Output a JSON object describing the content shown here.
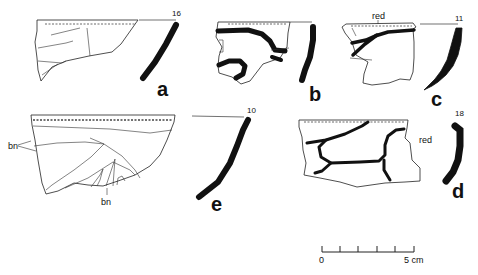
{
  "figure": {
    "sherds": [
      {
        "id": "a",
        "label": "a",
        "rim_diameter": "16",
        "annotations": []
      },
      {
        "id": "b",
        "label": "b",
        "rim_diameter": "",
        "annotations": []
      },
      {
        "id": "c",
        "label": "c",
        "rim_diameter": "11",
        "annotations": [
          "red"
        ]
      },
      {
        "id": "e",
        "label": "e",
        "rim_diameter": "10",
        "annotations": [
          "bn",
          "bn"
        ]
      },
      {
        "id": "d",
        "label": "d",
        "rim_diameter": "18",
        "annotations": [
          "red"
        ]
      }
    ],
    "scale_bar": {
      "start_label": "0",
      "end_label": "5 cm",
      "ticks": 6
    }
  }
}
